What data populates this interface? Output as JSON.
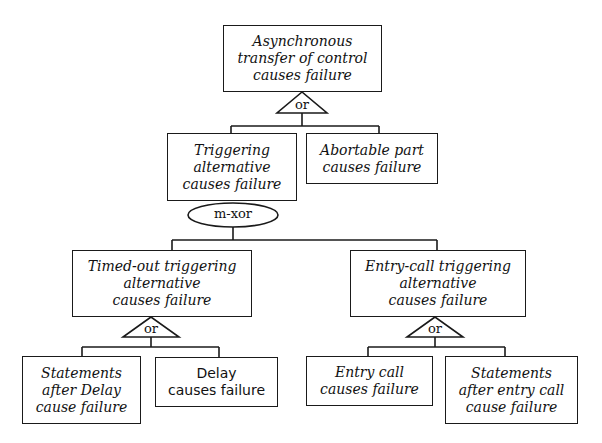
{
  "diagram": {
    "type": "fault-tree",
    "nodes": {
      "root": {
        "label": "Asynchronous\ntransfer of control\ncauses failure"
      },
      "triggering": {
        "label": "Triggering\nalternative\ncauses failure"
      },
      "abortable": {
        "label": "Abortable part\ncauses failure"
      },
      "timed_out": {
        "label": "Timed-out triggering\nalternative\ncauses failure"
      },
      "entry_call_trig": {
        "label": "Entry-call triggering\nalternative\ncauses failure"
      },
      "stmts_after_delay": {
        "label": "Statements\nafter Delay\ncause failure"
      },
      "delay": {
        "label": "Delay\ncauses failure"
      },
      "entry_call": {
        "label": "Entry call\ncauses failure"
      },
      "stmts_after_entry": {
        "label": "Statements\nafter entry call\ncause failure"
      }
    },
    "gates": {
      "root_gate": {
        "label": "or"
      },
      "triggering_gate": {
        "label": "m-xor"
      },
      "timed_out_gate": {
        "label": "or"
      },
      "entry_call_gate": {
        "label": "or"
      }
    }
  }
}
